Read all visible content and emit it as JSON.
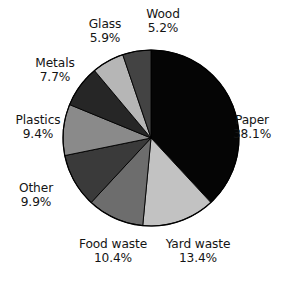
{
  "chart_data": {
    "type": "pie",
    "title": "",
    "subtitle": "",
    "xlabel": "",
    "ylabel": "",
    "grid": false,
    "legend_position": "none",
    "labels_outside": true,
    "start_angle_deg": 0,
    "direction": "clockwise",
    "categories": [
      "Paper",
      "Yard waste",
      "Food waste",
      "Other",
      "Plastics",
      "Metals",
      "Glass",
      "Wood"
    ],
    "values": [
      38.1,
      13.4,
      10.4,
      9.9,
      9.4,
      7.7,
      5.9,
      5.2
    ],
    "value_suffix": "%",
    "slices": [
      {
        "name": "Paper",
        "value": 38.1,
        "value_text": "38.1%",
        "color": "#050505",
        "label_name": "Paper",
        "label_pct": "38.1%"
      },
      {
        "name": "Yard waste",
        "value": 13.4,
        "value_text": "13.4%",
        "color": "#c2c2c2",
        "label_name": "Yard waste",
        "label_pct": "13.4%"
      },
      {
        "name": "Food waste",
        "value": 10.4,
        "value_text": "10.4%",
        "color": "#6d6d6d",
        "label_name": "Food waste",
        "label_pct": "10.4%"
      },
      {
        "name": "Other",
        "value": 9.9,
        "value_text": "9.9%",
        "color": "#3a3a3a",
        "label_name": "Other",
        "label_pct": "9.9%"
      },
      {
        "name": "Plastics",
        "value": 9.4,
        "value_text": "9.4%",
        "color": "#8a8a8a",
        "label_name": "Plastics",
        "label_pct": "9.4%"
      },
      {
        "name": "Metals",
        "value": 7.7,
        "value_text": "7.7%",
        "color": "#262626",
        "label_name": "Metals",
        "label_pct": "7.7%"
      },
      {
        "name": "Glass",
        "value": 5.9,
        "value_text": "5.9%",
        "color": "#b6b6b6",
        "label_name": "Glass",
        "label_pct": "5.9%"
      },
      {
        "name": "Wood",
        "value": 5.2,
        "value_text": "5.2%",
        "color": "#434343",
        "label_name": "Wood",
        "label_pct": "5.2%"
      }
    ],
    "geometry": {
      "center_x": 151,
      "center_y": 138,
      "radius": 88,
      "outline_color": "#000000"
    },
    "label_positions": [
      {
        "name": "Paper",
        "x": 252,
        "y": 114,
        "align": "center"
      },
      {
        "name": "Yard waste",
        "x": 198,
        "y": 238,
        "align": "center"
      },
      {
        "name": "Food waste",
        "x": 113,
        "y": 238,
        "align": "center"
      },
      {
        "name": "Other",
        "x": 36,
        "y": 182,
        "align": "center"
      },
      {
        "name": "Plastics",
        "x": 38,
        "y": 114,
        "align": "center"
      },
      {
        "name": "Metals",
        "x": 55,
        "y": 57,
        "align": "center"
      },
      {
        "name": "Glass",
        "x": 105,
        "y": 18,
        "align": "center"
      },
      {
        "name": "Wood",
        "x": 163,
        "y": 8,
        "align": "center"
      }
    ]
  }
}
